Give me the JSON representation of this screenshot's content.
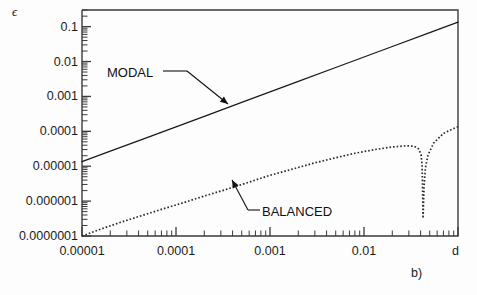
{
  "figure": {
    "caption": "b)",
    "y_axis_symbol": "ϵ",
    "x_axis_symbol": "d"
  },
  "chart_data": {
    "type": "line",
    "title": "",
    "subtitle": "",
    "xlabel": "d",
    "ylabel": "ϵ",
    "xscale": "log",
    "yscale": "log",
    "xlim": [
      1e-05,
      0.1
    ],
    "ylim": [
      1e-07,
      0.3
    ],
    "grid": false,
    "legend_position": "none",
    "xtick_labels": [
      "0.00001",
      "0.0001",
      "0.001",
      "0.01"
    ],
    "xtick_values": [
      1e-05,
      0.0001,
      0.001,
      0.01
    ],
    "ytick_labels": [
      "0.1",
      "0.01",
      "0.001",
      "0.0001",
      "0.00001",
      "0.000001",
      "0.0000001"
    ],
    "ytick_values": [
      0.1,
      0.01,
      0.001,
      0.0001,
      1e-05,
      1e-06,
      1e-07
    ],
    "minor_ticks": true,
    "annotations": [
      {
        "text": "MODAL",
        "series": "MODAL",
        "x": 0.00022,
        "y": 0.0035
      },
      {
        "text": "BALANCED",
        "series": "BALANCED",
        "x": 0.0013,
        "y": 6e-07
      }
    ],
    "series": [
      {
        "name": "MODAL",
        "style": "solid",
        "color": "#1a1a1a",
        "x": [
          1e-05,
          2e-05,
          5e-05,
          0.0001,
          0.0002,
          0.0005,
          0.001,
          0.002,
          0.005,
          0.01,
          0.02,
          0.05,
          0.1
        ],
        "y": [
          1.35e-05,
          2.7e-05,
          6.75e-05,
          0.000135,
          0.00027,
          0.000675,
          0.00135,
          0.0027,
          0.00675,
          0.0135,
          0.027,
          0.0675,
          0.135
        ]
      },
      {
        "name": "BALANCED",
        "style": "dotted",
        "color": "#2a2a2a",
        "x": [
          1e-05,
          1.5e-05,
          2.5e-05,
          4e-05,
          7e-05,
          0.00012,
          0.0002,
          0.00035,
          0.0006,
          0.001,
          0.0018,
          0.003,
          0.005,
          0.008,
          0.013,
          0.02,
          0.028,
          0.034,
          0.038,
          0.0405,
          0.0415,
          0.042,
          0.0425,
          0.0435,
          0.045,
          0.048,
          0.055,
          0.07,
          0.09,
          0.1
        ],
        "y": [
          1e-07,
          1.5e-07,
          2.4e-07,
          3.6e-07,
          5.8e-07,
          9e-07,
          1.4e-06,
          2.2e-06,
          3.5e-06,
          5.5e-06,
          8.5e-06,
          1.25e-05,
          1.75e-05,
          2.35e-05,
          3e-05,
          3.55e-05,
          3.85e-05,
          3.75e-05,
          3.15e-05,
          2.15e-05,
          1.05e-05,
          2.2e-06,
          3.2e-07,
          2.5e-06,
          9e-06,
          2.1e-05,
          4.6e-05,
          8.7e-05,
          0.00012,
          0.000135
        ]
      }
    ]
  }
}
